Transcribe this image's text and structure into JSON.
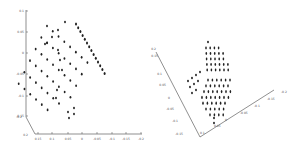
{
  "chart_data": [
    {
      "type": "scatter",
      "subtype": "3d-scatter",
      "title": "",
      "xlabel": "",
      "ylabel": "",
      "zlabel": "",
      "z_ticks": [
        "0.1",
        "0.05",
        "0",
        "-0.05",
        "-0.1",
        "-0.15"
      ],
      "x_ticks": [
        "0.15",
        "0.1",
        "0.05",
        "0",
        "-0.05",
        "-0.1",
        "-0.15",
        "-0.2"
      ],
      "y_ticks": [
        "-0.2",
        "0.2"
      ],
      "grid": false,
      "legend": null,
      "description": "Planar lattice of points forming a tilted parallelogram grid (~8x6 points) plus a dense edge row on the right side",
      "marker_color": "#222222"
    },
    {
      "type": "scatter",
      "subtype": "3d-scatter",
      "title": "",
      "xlabel": "",
      "ylabel": "",
      "zlabel": "",
      "left_axis_ticks": [
        "0.2",
        "0.15",
        "0.1",
        "0.05",
        "0",
        "-0.05",
        "-0.1",
        "-0.15"
      ],
      "right_axis_ticks": [
        "0.15",
        "0.1",
        "0.05",
        "0",
        "-0.05",
        "-0.1",
        "-0.15",
        "-0.2"
      ],
      "grid": false,
      "legend": null,
      "description": "Three planar clusters of points: upper triangular block (~5 rows), small diagonal strip on the left, and larger lower block (~7 rows tapering downward)",
      "marker_color": "#222222"
    }
  ],
  "left": {
    "axis_z_ticks": [
      {
        "label": "0.1",
        "y": 11
      },
      {
        "label": "0.05",
        "y": 32
      },
      {
        "label": "0",
        "y": 53
      },
      {
        "label": "-0.05",
        "y": 74
      },
      {
        "label": "-0.1",
        "y": 96
      },
      {
        "label": "-0.15",
        "y": 116
      }
    ],
    "axis_x_ticks": [
      {
        "label": "0.15",
        "x": 38
      },
      {
        "label": "0.1",
        "x": 52
      },
      {
        "label": "0.05",
        "x": 68
      },
      {
        "label": "0",
        "x": 82
      },
      {
        "label": "-0.05",
        "x": 97
      },
      {
        "label": "-0.1",
        "x": 112
      },
      {
        "label": "-0.15",
        "x": 126
      },
      {
        "label": "-0.2",
        "x": 141
      }
    ],
    "axis_y_ticks": [
      {
        "label": "-0.2",
        "x": 22,
        "y": 118
      },
      {
        "label": "0.2",
        "x": 28,
        "y": 136
      }
    ]
  },
  "right": {
    "left_axis_ticks": [
      {
        "label": "0.2",
        "x": 10,
        "y": 50
      },
      {
        "label": "0.15",
        "x": 12,
        "y": 57
      },
      {
        "label": "0.1",
        "x": 16,
        "y": 75
      },
      {
        "label": "0.05",
        "x": 20,
        "y": 86
      },
      {
        "label": "0",
        "x": 24,
        "y": 99
      },
      {
        "label": "-0.05",
        "x": 28,
        "y": 110
      },
      {
        "label": "-0.1",
        "x": 32,
        "y": 122
      },
      {
        "label": "-0.15",
        "x": 37,
        "y": 135
      }
    ],
    "right_axis_ticks": [
      {
        "label": "0.1",
        "x": 50,
        "y": 130
      },
      {
        "label": "0.05",
        "x": 64,
        "y": 123
      },
      {
        "label": "0",
        "x": 75,
        "y": 117
      },
      {
        "label": "-0.05",
        "x": 90,
        "y": 110
      },
      {
        "label": "-0.1",
        "x": 104,
        "y": 103
      },
      {
        "label": "-0.15",
        "x": 117,
        "y": 96
      },
      {
        "label": "-0.2",
        "x": 131,
        "y": 89
      }
    ]
  }
}
